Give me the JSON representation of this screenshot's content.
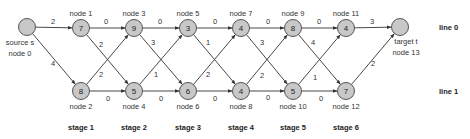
{
  "diagram": {
    "node_fill": "#c8c8c8",
    "node_stroke": "#555555",
    "edge_color": "#333333",
    "radius": 8.5,
    "nodes": [
      {
        "id": 0,
        "x": 27,
        "y": 27,
        "value": "",
        "label_lines": [
          "source s",
          "node 0"
        ],
        "label_pos": "below-left"
      },
      {
        "id": 1,
        "x": 81,
        "y": 28,
        "value": "7",
        "label_lines": [
          "node 1"
        ],
        "label_pos": "above"
      },
      {
        "id": 2,
        "x": 81,
        "y": 91,
        "value": "8",
        "label_lines": [
          "node 2"
        ],
        "label_pos": "below"
      },
      {
        "id": 3,
        "x": 134,
        "y": 28,
        "value": "9",
        "label_lines": [
          "node 3"
        ],
        "label_pos": "above"
      },
      {
        "id": 4,
        "x": 134,
        "y": 91,
        "value": "5",
        "label_lines": [
          "node 4"
        ],
        "label_pos": "below"
      },
      {
        "id": 5,
        "x": 188,
        "y": 28,
        "value": "3",
        "label_lines": [
          "node 5"
        ],
        "label_pos": "above"
      },
      {
        "id": 6,
        "x": 188,
        "y": 91,
        "value": "6",
        "label_lines": [
          "node 6"
        ],
        "label_pos": "below"
      },
      {
        "id": 7,
        "x": 241,
        "y": 28,
        "value": "4",
        "label_lines": [
          "node 7"
        ],
        "label_pos": "above"
      },
      {
        "id": 8,
        "x": 241,
        "y": 91,
        "value": "4",
        "label_lines": [
          "node 8"
        ],
        "label_pos": "below"
      },
      {
        "id": 9,
        "x": 293,
        "y": 28,
        "value": "8",
        "label_lines": [
          "node 9"
        ],
        "label_pos": "above"
      },
      {
        "id": 10,
        "x": 293,
        "y": 91,
        "value": "5",
        "label_lines": [
          "node 10"
        ],
        "label_pos": "below"
      },
      {
        "id": 11,
        "x": 346,
        "y": 28,
        "value": "4",
        "label_lines": [
          "node 11"
        ],
        "label_pos": "above"
      },
      {
        "id": 12,
        "x": 346,
        "y": 91,
        "value": "7",
        "label_lines": [
          "node 12"
        ],
        "label_pos": "below"
      },
      {
        "id": 13,
        "x": 400,
        "y": 27,
        "value": "",
        "label_lines": [
          "target t",
          "node 13"
        ],
        "label_pos": "below-right"
      }
    ],
    "edges": [
      {
        "from": 0,
        "to": 1,
        "weight": "2",
        "lx": 53,
        "ly": 21
      },
      {
        "from": 0,
        "to": 2,
        "weight": "4",
        "lx": 53,
        "ly": 63
      },
      {
        "from": 1,
        "to": 3,
        "weight": "0",
        "lx": 106,
        "ly": 21
      },
      {
        "from": 1,
        "to": 4,
        "weight": "2",
        "lx": 101,
        "ly": 44
      },
      {
        "from": 2,
        "to": 3,
        "weight": "2",
        "lx": 101,
        "ly": 74
      },
      {
        "from": 2,
        "to": 4,
        "weight": "0",
        "lx": 108,
        "ly": 98
      },
      {
        "from": 3,
        "to": 5,
        "weight": "0",
        "lx": 160,
        "ly": 21
      },
      {
        "from": 3,
        "to": 6,
        "weight": "3",
        "lx": 153,
        "ly": 42
      },
      {
        "from": 4,
        "to": 5,
        "weight": "1",
        "lx": 156,
        "ly": 74
      },
      {
        "from": 4,
        "to": 6,
        "weight": "0",
        "lx": 161,
        "ly": 98
      },
      {
        "from": 5,
        "to": 7,
        "weight": "0",
        "lx": 215,
        "ly": 21
      },
      {
        "from": 5,
        "to": 8,
        "weight": "1",
        "lx": 208,
        "ly": 42
      },
      {
        "from": 6,
        "to": 7,
        "weight": "2",
        "lx": 208,
        "ly": 74
      },
      {
        "from": 6,
        "to": 8,
        "weight": "0",
        "lx": 215,
        "ly": 98
      },
      {
        "from": 7,
        "to": 9,
        "weight": "0",
        "lx": 268,
        "ly": 21
      },
      {
        "from": 7,
        "to": 10,
        "weight": "3",
        "lx": 262,
        "ly": 42
      },
      {
        "from": 8,
        "to": 9,
        "weight": "2",
        "lx": 262,
        "ly": 75
      },
      {
        "from": 8,
        "to": 10,
        "weight": "0",
        "lx": 268,
        "ly": 97
      },
      {
        "from": 9,
        "to": 11,
        "weight": "0",
        "lx": 319,
        "ly": 21
      },
      {
        "from": 9,
        "to": 12,
        "weight": "4",
        "lx": 313,
        "ly": 42
      },
      {
        "from": 10,
        "to": 11,
        "weight": "1",
        "lx": 315,
        "ly": 77
      },
      {
        "from": 10,
        "to": 12,
        "weight": "0",
        "lx": 321,
        "ly": 98
      },
      {
        "from": 11,
        "to": 13,
        "weight": "3",
        "lx": 372,
        "ly": 21
      },
      {
        "from": 12,
        "to": 13,
        "weight": "2",
        "lx": 373,
        "ly": 63
      }
    ],
    "stages": [
      {
        "label": "stage 1",
        "x": 81
      },
      {
        "label": "stage 2",
        "x": 134
      },
      {
        "label": "stage 3",
        "x": 188
      },
      {
        "label": "stage 4",
        "x": 241
      },
      {
        "label": "stage 5",
        "x": 293
      },
      {
        "label": "stage 6",
        "x": 346
      }
    ],
    "lines": [
      {
        "label": "line 0",
        "x": 439,
        "y": 30
      },
      {
        "label": "line 1",
        "x": 439,
        "y": 94
      }
    ],
    "stage_y": 130
  }
}
